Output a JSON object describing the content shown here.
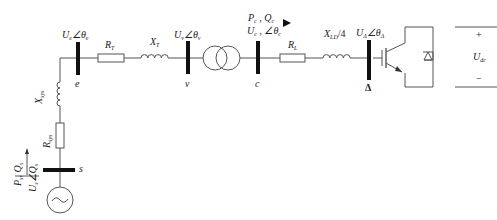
{
  "diagram": {
    "type": "single-line circuit diagram",
    "colors": {
      "line": "#555555",
      "bus": "#111111",
      "text": "#222222",
      "background": "#ffffff"
    },
    "buses": [
      {
        "id": "e",
        "label": "e",
        "voltage": "U_e∠θ_e",
        "U": "U",
        "U_sub": "e",
        "theta": "θ",
        "theta_sub": "e"
      },
      {
        "id": "v",
        "label": "v",
        "voltage": "U_v∠θ_v",
        "U": "U",
        "U_sub": "v",
        "theta": "θ",
        "theta_sub": "v"
      },
      {
        "id": "c",
        "label": "c",
        "voltage": "U_c∠θ_c",
        "U": "U",
        "U_sub": "c",
        "theta": "θ",
        "theta_sub": "c"
      },
      {
        "id": "delta",
        "label": "Δ",
        "voltage": "U_Δ∠θ_Δ",
        "U": "U",
        "U_sub": "Δ",
        "theta": "θ",
        "theta_sub": "Δ"
      },
      {
        "id": "s",
        "label": "s"
      }
    ],
    "components": {
      "RT": {
        "main": "R",
        "sub": "T"
      },
      "XT": {
        "main": "X",
        "sub": "T"
      },
      "RL": {
        "main": "R",
        "sub": "L"
      },
      "XLD": {
        "main": "X",
        "sub": "LD",
        "suffix": "/4"
      },
      "Xsys": {
        "main": "X",
        "sub": "sys"
      },
      "Rsys": {
        "main": "R",
        "sub": "sys"
      },
      "transformer": "two-winding transformer",
      "source": "AC source",
      "converter": "IGBT with anti-parallel diode"
    },
    "power_flow_c": {
      "P": "P",
      "P_sub": "c",
      "Q": "Q",
      "Q_sub": "c",
      "sep": " , "
    },
    "power_flow_s": {
      "P": "P",
      "P_sub": "s",
      "Q": "Q",
      "Q_sub": "s",
      "U": "U",
      "U_sub": "s",
      "theta": "Q",
      "theta_sub": "s"
    },
    "dc": {
      "label": "U",
      "label_sub": "dc",
      "plus": "+",
      "minus": "−"
    },
    "angle_symbol": "∠"
  }
}
